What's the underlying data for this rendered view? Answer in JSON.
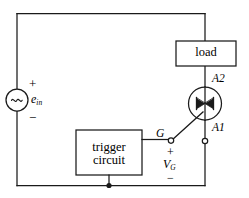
{
  "figure": {
    "type": "circuit-schematic",
    "stroke_color": "#1a1a1a",
    "background_color": "#ffffff"
  },
  "source": {
    "name": "ac-voltage-source",
    "symbol": "~",
    "label": "e",
    "label_subscript": "in",
    "plus_sign": "+",
    "minus_sign": "−"
  },
  "load": {
    "label": "load"
  },
  "trigger": {
    "line1": "trigger",
    "line2": "circuit"
  },
  "triac": {
    "terminal_top": "A2",
    "terminal_bottom": "A1",
    "gate_label": "G",
    "gate_voltage": "V",
    "gate_voltage_subscript": "G",
    "plus_sign": "+",
    "minus_sign": "−"
  }
}
